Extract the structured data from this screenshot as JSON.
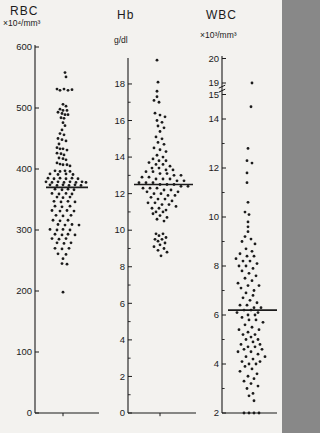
{
  "page": {
    "background": "#f3f2ef",
    "ink": "#1b1b1b"
  },
  "chart_data": [
    {
      "type": "scatter",
      "variant": "strip-dot-plot",
      "title": "RBC",
      "unit": "×10⁴/mm³",
      "ylim": [
        0,
        620
      ],
      "grid": false,
      "mean": 370,
      "ticks_labeled": [
        [
          600,
          "600"
        ],
        [
          500,
          "500"
        ],
        [
          400,
          "400"
        ],
        [
          300,
          "300"
        ],
        [
          200,
          "200"
        ],
        [
          100,
          "100"
        ],
        [
          0,
          "0"
        ]
      ],
      "ticks_minor": [],
      "points": [
        [
          558,
          1
        ],
        [
          551,
          2
        ],
        [
          531,
          -7
        ],
        [
          529,
          -4
        ],
        [
          531,
          0
        ],
        [
          529,
          4
        ],
        [
          530,
          8
        ],
        [
          506,
          -1
        ],
        [
          503,
          2
        ],
        [
          498,
          -4
        ],
        [
          496,
          -1
        ],
        [
          496,
          3
        ],
        [
          493,
          -6
        ],
        [
          491,
          -2
        ],
        [
          489,
          1
        ],
        [
          489,
          4
        ],
        [
          484,
          -3
        ],
        [
          483,
          0
        ],
        [
          476,
          -1
        ],
        [
          471,
          1
        ],
        [
          464,
          -2
        ],
        [
          458,
          -4
        ],
        [
          456,
          0
        ],
        [
          450,
          -6
        ],
        [
          448,
          -2
        ],
        [
          446,
          2
        ],
        [
          441,
          -5
        ],
        [
          435,
          -7
        ],
        [
          433,
          -4
        ],
        [
          433,
          -1
        ],
        [
          431,
          3
        ],
        [
          426,
          -7
        ],
        [
          425,
          -3
        ],
        [
          423,
          0
        ],
        [
          418,
          -5
        ],
        [
          417,
          -1
        ],
        [
          415,
          2
        ],
        [
          410,
          -7
        ],
        [
          408,
          -4
        ],
        [
          407,
          -1
        ],
        [
          407,
          3
        ],
        [
          405,
          6
        ],
        [
          397,
          -9
        ],
        [
          396,
          -4
        ],
        [
          397,
          1
        ],
        [
          396,
          6
        ],
        [
          392,
          -14
        ],
        [
          391,
          -6
        ],
        [
          392,
          2
        ],
        [
          391,
          9
        ],
        [
          385,
          -16
        ],
        [
          384,
          -10
        ],
        [
          385,
          -4
        ],
        [
          384,
          2
        ],
        [
          385,
          8
        ],
        [
          384,
          14
        ],
        [
          379,
          -18
        ],
        [
          378,
          -12
        ],
        [
          379,
          -6
        ],
        [
          378,
          0
        ],
        [
          379,
          6
        ],
        [
          378,
          12
        ],
        [
          379,
          18
        ],
        [
          378,
          22
        ],
        [
          374,
          -14
        ],
        [
          373,
          -7
        ],
        [
          374,
          -1
        ],
        [
          373,
          5
        ],
        [
          374,
          11
        ],
        [
          373,
          17
        ],
        [
          367,
          -9
        ],
        [
          366,
          -2
        ],
        [
          367,
          4
        ],
        [
          366,
          10
        ],
        [
          360,
          -12
        ],
        [
          359,
          -5
        ],
        [
          360,
          2
        ],
        [
          359,
          8
        ],
        [
          354,
          -7
        ],
        [
          353,
          -1
        ],
        [
          354,
          6
        ],
        [
          347,
          -10
        ],
        [
          346,
          -3
        ],
        [
          347,
          4
        ],
        [
          346,
          11
        ],
        [
          339,
          -9
        ],
        [
          338,
          -2
        ],
        [
          339,
          6
        ],
        [
          332,
          -12
        ],
        [
          331,
          -4
        ],
        [
          332,
          3
        ],
        [
          331,
          10
        ],
        [
          324,
          -8
        ],
        [
          323,
          -1
        ],
        [
          324,
          7
        ],
        [
          316,
          -11
        ],
        [
          315,
          -4
        ],
        [
          316,
          4
        ],
        [
          309,
          -6
        ],
        [
          308,
          1
        ],
        [
          309,
          8
        ],
        [
          308,
          15
        ],
        [
          301,
          -14
        ],
        [
          300,
          -7
        ],
        [
          301,
          -1
        ],
        [
          300,
          6
        ],
        [
          293,
          -9
        ],
        [
          292,
          -2
        ],
        [
          293,
          4
        ],
        [
          292,
          11
        ],
        [
          286,
          -12
        ],
        [
          285,
          -5
        ],
        [
          286,
          2
        ],
        [
          279,
          -7
        ],
        [
          278,
          0
        ],
        [
          279,
          7
        ],
        [
          270,
          -9
        ],
        [
          269,
          -2
        ],
        [
          270,
          5
        ],
        [
          261,
          -6
        ],
        [
          260,
          2
        ],
        [
          253,
          -1
        ],
        [
          245,
          -2
        ],
        [
          244,
          3
        ],
        [
          198,
          -1
        ]
      ]
    },
    {
      "type": "scatter",
      "variant": "strip-dot-plot",
      "title": "Hb",
      "unit": "g/dl",
      "ylim": [
        0,
        19.4
      ],
      "grid": false,
      "mean": 12.5,
      "ticks_labeled": [
        [
          18,
          "18"
        ],
        [
          16,
          "16"
        ],
        [
          14,
          "14"
        ],
        [
          12,
          "12"
        ],
        [
          10,
          "10"
        ],
        [
          8,
          "8"
        ],
        [
          6,
          "6"
        ],
        [
          4,
          "4"
        ],
        [
          2,
          "2"
        ],
        [
          0,
          "0"
        ]
      ],
      "ticks_minor": [
        17,
        15,
        13,
        11,
        9,
        7,
        5,
        3,
        1
      ],
      "points": [
        [
          19.3,
          -4
        ],
        [
          18.1,
          -3
        ],
        [
          17.6,
          -4
        ],
        [
          17.3,
          -4
        ],
        [
          17.1,
          -7
        ],
        [
          17.0,
          -2
        ],
        [
          16.4,
          -6
        ],
        [
          16.3,
          -1
        ],
        [
          16.2,
          4
        ],
        [
          16.0,
          -4
        ],
        [
          15.9,
          1
        ],
        [
          15.7,
          -3
        ],
        [
          15.6,
          3
        ],
        [
          15.4,
          -1
        ],
        [
          15.1,
          -5
        ],
        [
          15.0,
          1
        ],
        [
          14.8,
          -3
        ],
        [
          14.7,
          3
        ],
        [
          14.5,
          -7
        ],
        [
          14.4,
          -1
        ],
        [
          14.3,
          5
        ],
        [
          14.1,
          -4
        ],
        [
          14.0,
          2
        ],
        [
          13.9,
          -8
        ],
        [
          13.8,
          -2
        ],
        [
          13.8,
          5
        ],
        [
          13.7,
          -12
        ],
        [
          13.6,
          -5
        ],
        [
          13.6,
          2
        ],
        [
          13.5,
          9
        ],
        [
          13.4,
          -9
        ],
        [
          13.4,
          -2
        ],
        [
          13.3,
          5
        ],
        [
          13.3,
          12
        ],
        [
          13.2,
          -15
        ],
        [
          13.2,
          -8
        ],
        [
          13.1,
          -1
        ],
        [
          13.1,
          6
        ],
        [
          13.0,
          13
        ],
        [
          13.0,
          20
        ],
        [
          12.9,
          -19
        ],
        [
          12.9,
          -12
        ],
        [
          12.8,
          -5
        ],
        [
          12.8,
          2
        ],
        [
          12.8,
          9
        ],
        [
          12.7,
          16
        ],
        [
          12.7,
          23
        ],
        [
          12.6,
          -22
        ],
        [
          12.6,
          -15
        ],
        [
          12.6,
          -8
        ],
        [
          12.5,
          -1
        ],
        [
          12.5,
          6
        ],
        [
          12.5,
          13
        ],
        [
          12.4,
          20
        ],
        [
          12.4,
          27
        ],
        [
          12.3,
          -18
        ],
        [
          12.3,
          -11
        ],
        [
          12.3,
          -4
        ],
        [
          12.2,
          3
        ],
        [
          12.2,
          10
        ],
        [
          12.1,
          17
        ],
        [
          12.1,
          -14
        ],
        [
          12.0,
          -7
        ],
        [
          12.0,
          0
        ],
        [
          11.9,
          7
        ],
        [
          11.9,
          14
        ],
        [
          11.8,
          -10
        ],
        [
          11.7,
          -3
        ],
        [
          11.7,
          4
        ],
        [
          11.6,
          11
        ],
        [
          11.5,
          -13
        ],
        [
          11.5,
          -6
        ],
        [
          11.4,
          1
        ],
        [
          11.4,
          8
        ],
        [
          11.3,
          15
        ],
        [
          11.2,
          -9
        ],
        [
          11.2,
          -2
        ],
        [
          11.1,
          5
        ],
        [
          11.0,
          -5
        ],
        [
          11.0,
          2
        ],
        [
          10.9,
          -8
        ],
        [
          10.8,
          -1
        ],
        [
          10.7,
          6
        ],
        [
          10.6,
          -4
        ],
        [
          10.5,
          3
        ],
        [
          9.8,
          -5
        ],
        [
          9.8,
          2
        ],
        [
          9.7,
          -2
        ],
        [
          9.6,
          5
        ],
        [
          9.5,
          -6
        ],
        [
          9.5,
          1
        ],
        [
          9.4,
          -3
        ],
        [
          9.3,
          4
        ],
        [
          9.2,
          -1
        ],
        [
          9.1,
          -7
        ],
        [
          9.0,
          3
        ],
        [
          8.9,
          -3
        ],
        [
          8.8,
          6
        ],
        [
          8.6,
          0
        ]
      ]
    },
    {
      "type": "scatter",
      "variant": "strip-dot-plot",
      "title": "WBC",
      "unit": "×10³/mm³",
      "ylim": [
        2,
        20
      ],
      "grid": false,
      "mean": 6.2,
      "scale_break": {
        "from": 15,
        "to": 19
      },
      "ticks_labeled": [
        [
          20,
          "20"
        ],
        [
          19,
          "19"
        ],
        [
          15,
          "15"
        ],
        [
          14,
          "14"
        ],
        [
          12,
          "12"
        ],
        [
          10,
          "10"
        ],
        [
          8,
          "8"
        ],
        [
          6,
          "6"
        ],
        [
          4,
          "4"
        ],
        [
          2,
          "2"
        ]
      ],
      "ticks_minor": [
        13,
        11,
        9,
        7,
        5,
        3
      ],
      "points": [
        [
          19.0,
          0
        ],
        [
          14.5,
          -1
        ],
        [
          12.8,
          -4
        ],
        [
          12.3,
          -5
        ],
        [
          12.2,
          0
        ],
        [
          11.8,
          -5
        ],
        [
          11.4,
          -5
        ],
        [
          10.6,
          -4
        ],
        [
          10.2,
          -7
        ],
        [
          10.1,
          -3
        ],
        [
          9.8,
          -4
        ],
        [
          9.6,
          -4
        ],
        [
          9.4,
          -4
        ],
        [
          9.2,
          -7
        ],
        [
          9.1,
          -1
        ],
        [
          9.0,
          -10
        ],
        [
          8.9,
          3
        ],
        [
          8.7,
          -6
        ],
        [
          8.6,
          0
        ],
        [
          8.5,
          -12
        ],
        [
          8.4,
          -5
        ],
        [
          8.4,
          2
        ],
        [
          8.3,
          -16
        ],
        [
          8.2,
          -9
        ],
        [
          8.2,
          -2
        ],
        [
          8.1,
          5
        ],
        [
          8.0,
          -13
        ],
        [
          8.0,
          -6
        ],
        [
          7.9,
          1
        ],
        [
          7.8,
          -10
        ],
        [
          7.7,
          -3
        ],
        [
          7.6,
          4
        ],
        [
          7.5,
          -7
        ],
        [
          7.4,
          0
        ],
        [
          7.3,
          -14
        ],
        [
          7.2,
          -4
        ],
        [
          7.2,
          7
        ],
        [
          7.1,
          -11
        ],
        [
          7.0,
          2
        ],
        [
          6.9,
          -6
        ],
        [
          6.8,
          1
        ],
        [
          6.7,
          -9
        ],
        [
          6.6,
          -2
        ],
        [
          6.5,
          5
        ],
        [
          6.4,
          -12
        ],
        [
          6.4,
          -5
        ],
        [
          6.3,
          2
        ],
        [
          6.3,
          9
        ],
        [
          6.2,
          -8
        ],
        [
          6.2,
          -1
        ],
        [
          6.1,
          6
        ],
        [
          6.1,
          -15
        ],
        [
          6.0,
          -4
        ],
        [
          6.0,
          3
        ],
        [
          5.9,
          -10
        ],
        [
          5.8,
          -3
        ],
        [
          5.8,
          4
        ],
        [
          5.7,
          11
        ],
        [
          5.6,
          -7
        ],
        [
          5.5,
          0
        ],
        [
          5.4,
          -13
        ],
        [
          5.4,
          7
        ],
        [
          5.3,
          -4
        ],
        [
          5.2,
          3
        ],
        [
          5.2,
          -9
        ],
        [
          5.1,
          -1
        ],
        [
          5.0,
          6
        ],
        [
          5.0,
          -6
        ],
        [
          4.9,
          1
        ],
        [
          4.8,
          -11
        ],
        [
          4.8,
          8
        ],
        [
          4.7,
          -4
        ],
        [
          4.7,
          3
        ],
        [
          4.6,
          -8
        ],
        [
          4.6,
          10
        ],
        [
          4.5,
          -1
        ],
        [
          4.5,
          -14
        ],
        [
          4.4,
          6
        ],
        [
          4.3,
          -6
        ],
        [
          4.3,
          13
        ],
        [
          4.2,
          1
        ],
        [
          4.1,
          -10
        ],
        [
          4.1,
          8
        ],
        [
          4.0,
          -3
        ],
        [
          4.0,
          4
        ],
        [
          3.9,
          -7
        ],
        [
          3.8,
          0
        ],
        [
          3.7,
          -12
        ],
        [
          3.6,
          5
        ],
        [
          3.5,
          -4
        ],
        [
          3.4,
          2
        ],
        [
          3.3,
          -8
        ],
        [
          3.2,
          -1
        ],
        [
          3.1,
          6
        ],
        [
          3.0,
          -5
        ],
        [
          2.8,
          1
        ],
        [
          2.7,
          -3
        ],
        [
          2.5,
          2
        ],
        [
          2.0,
          -8
        ],
        [
          2.0,
          -3
        ],
        [
          2.0,
          2
        ],
        [
          2.0,
          7
        ]
      ]
    }
  ]
}
